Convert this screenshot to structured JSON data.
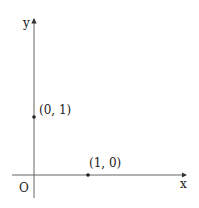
{
  "diagram": {
    "axes": {
      "x_label": "x",
      "y_label": "y",
      "origin_label": "O"
    },
    "points": [
      {
        "label": "(0, 1)",
        "x": 0,
        "y": 1
      },
      {
        "label": "(1, 0)",
        "x": 1,
        "y": 0
      }
    ],
    "colors": {
      "ink": "#333333"
    }
  }
}
